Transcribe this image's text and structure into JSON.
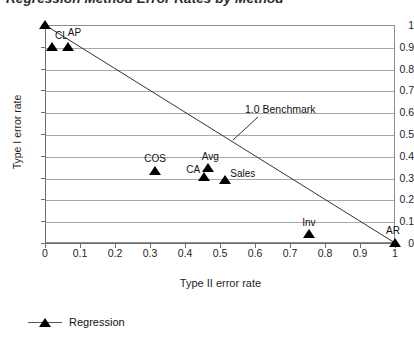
{
  "chart_data": {
    "type": "scatter",
    "title": "Regression Method Error Rates by Method",
    "xlabel": "Type II error rate",
    "ylabel": "Type I error rate",
    "xlim": [
      0,
      1
    ],
    "ylim": [
      0,
      1
    ],
    "grid": true,
    "x_ticks": [
      "0",
      "0.1",
      "0.2",
      "0.3",
      "0.4",
      "0.5",
      "0.6",
      "0.7",
      "0.8",
      "0.9",
      "1"
    ],
    "y_ticks": [
      "1",
      "0.9",
      "0.8",
      "0.7",
      "0.6",
      "0.5",
      "0.4",
      "0.3",
      "0.2",
      "0.1",
      "0"
    ],
    "x_tick_values": [
      0,
      0.1,
      0.2,
      0.3,
      0.4,
      0.5,
      0.6,
      0.7,
      0.8,
      0.9,
      1
    ],
    "y_tick_values": [
      1,
      0.9,
      0.8,
      0.7,
      0.6,
      0.5,
      0.4,
      0.3,
      0.2,
      0.1,
      0
    ],
    "series": [
      {
        "name": "Regression",
        "marker": "triangle",
        "color": "#000000",
        "points": [
          {
            "label": "",
            "x": 0.0,
            "y": 1.0,
            "label_dx": 0,
            "label_dy": 0
          },
          {
            "label": "CL",
            "x": 0.02,
            "y": 0.9,
            "label_dx": 3,
            "label_dy": -17
          },
          {
            "label": "AP",
            "x": 0.065,
            "y": 0.9,
            "label_dx": 0,
            "label_dy": -20
          },
          {
            "label": "COS",
            "x": 0.315,
            "y": 0.33,
            "label_dx": -11,
            "label_dy": -18
          },
          {
            "label": "Avg",
            "x": 0.465,
            "y": 0.345,
            "label_dx": -6,
            "label_dy": -17
          },
          {
            "label": "CA",
            "x": 0.455,
            "y": 0.305,
            "label_dx": -18,
            "label_dy": -13
          },
          {
            "label": "Sales",
            "x": 0.515,
            "y": 0.29,
            "label_dx": 5,
            "label_dy": -12
          },
          {
            "label": "Inv",
            "x": 0.755,
            "y": 0.04,
            "label_dx": -7,
            "label_dy": -17
          },
          {
            "label": "AR",
            "x": 1.0,
            "y": 0.0,
            "label_dx": -9,
            "label_dy": -18
          }
        ]
      }
    ],
    "reference_line": {
      "label": "1.0 Benchmark",
      "from": {
        "x": 0.0,
        "y": 1.0
      },
      "to": {
        "x": 1.0,
        "y": 0.0
      }
    },
    "legend": {
      "position": "bottom-left",
      "entries": [
        {
          "label": "Regression",
          "marker": "triangle",
          "color": "#000000"
        }
      ]
    }
  },
  "legend_label": "Regression"
}
